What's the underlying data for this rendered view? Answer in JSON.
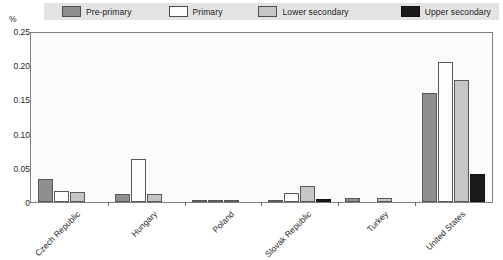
{
  "legend": {
    "items": [
      {
        "label": "Pre-primary",
        "color": "#8f8f8f",
        "icon": "legend-swatch-icon"
      },
      {
        "label": "Primary",
        "color": "#fdfdfd",
        "icon": "legend-swatch-icon"
      },
      {
        "label": "Lower secondary",
        "color": "#c6c6c6",
        "icon": "legend-swatch-icon"
      },
      {
        "label": "Upper secondary",
        "color": "#1b1b1b",
        "icon": "legend-swatch-icon"
      }
    ]
  },
  "axis": {
    "y_unit": "%",
    "y_ticks": [
      "0.25",
      "0.20",
      "0.15",
      "0.10",
      "0.05",
      "0"
    ]
  },
  "chart_data": {
    "type": "bar",
    "title": "",
    "subtitle": "",
    "xlabel": "",
    "ylabel": "%",
    "ylim": [
      0,
      0.25
    ],
    "ytick_values": [
      0.25,
      0.2,
      0.15,
      0.1,
      0.05,
      0
    ],
    "grid": false,
    "legend_position": "top",
    "categories": [
      "Czech Republic",
      "Hungary",
      "Poland",
      "Slovak Republic",
      "Turkey",
      "United States"
    ],
    "series": [
      {
        "name": "Pre-primary",
        "color": "#8f8f8f",
        "values": [
          0.034,
          0.012,
          0.002,
          0.002,
          0.006,
          0.159
        ]
      },
      {
        "name": "Primary",
        "color": "#fdfdfd",
        "values": [
          0.016,
          0.063,
          0.002,
          0.013,
          0.0,
          0.205
        ]
      },
      {
        "name": "Lower secondary",
        "color": "#c6c6c6",
        "values": [
          0.014,
          0.012,
          0.002,
          0.024,
          0.006,
          0.178
        ]
      },
      {
        "name": "Upper secondary",
        "color": "#1b1b1b",
        "values": [
          0.0,
          0.0,
          0.0,
          0.004,
          0.0,
          0.041
        ]
      }
    ]
  }
}
